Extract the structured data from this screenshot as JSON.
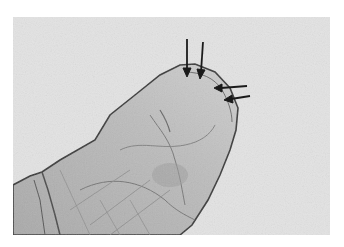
{
  "figure": {
    "background_color": "#ffffff",
    "field_color": "#e3e3e3",
    "body_color": "#bdbdbd",
    "outline_color": "#3a3a3a",
    "arrow_color": "#1a1a1a",
    "arrows": [
      {
        "id": 1,
        "direction": "down",
        "tip": [
          187,
          75
        ]
      },
      {
        "id": 2,
        "direction": "down",
        "tip": [
          201,
          77
        ]
      },
      {
        "id": 3,
        "direction": "left",
        "tip": [
          215,
          88
        ]
      },
      {
        "id": 4,
        "direction": "left",
        "tip": [
          225,
          99
        ]
      }
    ]
  }
}
